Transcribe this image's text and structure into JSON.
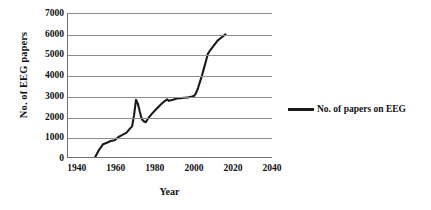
{
  "chart_data": {
    "type": "line",
    "title": "",
    "xlabel": "Year",
    "ylabel": "No. of EEG papers",
    "xlim": [
      1935,
      2040
    ],
    "ylim": [
      0,
      7000
    ],
    "xticks": [
      1940,
      1960,
      1980,
      2000,
      2020,
      2040
    ],
    "yticks": [
      0,
      1000,
      2000,
      3000,
      4000,
      5000,
      6000,
      7000
    ],
    "grid": "horizontal",
    "legend_position": "right",
    "series": [
      {
        "name": "No. of papers on EEG",
        "color": "#1a1a1a",
        "x": [
          1949,
          1951,
          1953,
          1955,
          1957,
          1959,
          1961,
          1963,
          1965,
          1967,
          1968,
          1969,
          1970,
          1971,
          1972,
          1973,
          1974,
          1975,
          1976,
          1978,
          1980,
          1982,
          1984,
          1986,
          1987,
          1989,
          1991,
          1993,
          1995,
          1997,
          1999,
          2000,
          2001,
          2002,
          2003,
          2004,
          2005,
          2006,
          2007,
          2008,
          2010,
          2012,
          2014,
          2016
        ],
        "y": [
          0,
          350,
          620,
          700,
          780,
          820,
          980,
          1080,
          1180,
          1400,
          1500,
          2050,
          2800,
          2600,
          2200,
          1850,
          1750,
          1700,
          1850,
          2100,
          2300,
          2500,
          2680,
          2820,
          2750,
          2800,
          2860,
          2880,
          2900,
          2920,
          2960,
          3000,
          3150,
          3400,
          3700,
          4000,
          4350,
          4700,
          5050,
          5200,
          5450,
          5700,
          5850,
          6000
        ]
      }
    ]
  },
  "axes": {
    "y_tick_labels": [
      "7000",
      "6000",
      "5000",
      "4000",
      "3000",
      "2000",
      "1000",
      "0"
    ],
    "x_tick_labels": [
      "1940",
      "1960",
      "1980",
      "2000",
      "2020",
      "2040"
    ],
    "y_axis_title": "No. of EEG papers",
    "x_axis_title": "Year"
  },
  "legend": {
    "label": "No. of papers on EEG"
  }
}
